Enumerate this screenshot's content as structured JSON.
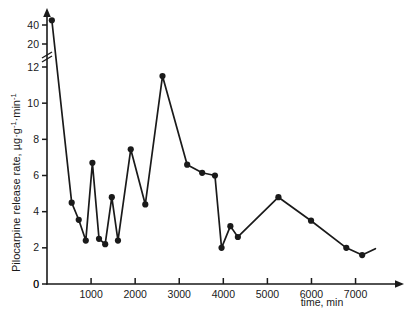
{
  "chart_data": {
    "type": "line",
    "title": "",
    "subtitle": "",
    "xlabel": "time, min",
    "ylabel": "Pilocarpine  release rate, µg·g⁻¹·min⁻¹",
    "ylabel_parts": {
      "main": "Pilocarpine  release rate, µg·g",
      "sup1": "-1",
      "mid": "·min",
      "sup2": "-1"
    },
    "xlim": [
      0,
      7600
    ],
    "ylim": [
      0,
      48
    ],
    "xticks": [
      0,
      1000,
      2000,
      3000,
      4000,
      5000,
      6000,
      7000
    ],
    "xticklabels": [
      "0",
      "1000",
      "2000",
      "3000",
      "4000",
      "5000",
      "6000",
      "7000"
    ],
    "yticks": [
      0,
      2,
      4,
      6,
      8,
      10,
      12,
      20,
      40
    ],
    "yticklabels": [
      "0",
      "2",
      "4",
      "6",
      "8",
      "10",
      "12",
      "20",
      "40"
    ],
    "y_axis_break": {
      "present": true,
      "between": [
        12,
        20
      ],
      "note": "broken (compressed) axis above 12"
    },
    "grid": false,
    "legend": null,
    "axis_arrows": {
      "x": true,
      "y": true
    },
    "marker": "filled-circle",
    "series": [
      {
        "name": "Pilocarpine release rate",
        "points": [
          {
            "x": 110,
            "y": 45.0
          },
          {
            "x": 560,
            "y": 4.5
          },
          {
            "x": 720,
            "y": 3.55
          },
          {
            "x": 880,
            "y": 2.4
          },
          {
            "x": 1030,
            "y": 6.7
          },
          {
            "x": 1180,
            "y": 2.5
          },
          {
            "x": 1320,
            "y": 2.2
          },
          {
            "x": 1470,
            "y": 4.8
          },
          {
            "x": 1610,
            "y": 2.4
          },
          {
            "x": 1900,
            "y": 7.45
          },
          {
            "x": 2230,
            "y": 4.4
          },
          {
            "x": 2620,
            "y": 11.5
          },
          {
            "x": 3180,
            "y": 6.6
          },
          {
            "x": 3520,
            "y": 6.15
          },
          {
            "x": 3810,
            "y": 6.0
          },
          {
            "x": 3960,
            "y": 2.0
          },
          {
            "x": 4160,
            "y": 3.2
          },
          {
            "x": 4330,
            "y": 2.6
          },
          {
            "x": 5250,
            "y": 4.8
          },
          {
            "x": 5990,
            "y": 3.5
          },
          {
            "x": 6790,
            "y": 2.0
          },
          {
            "x": 7150,
            "y": 1.6
          },
          {
            "x": 7450,
            "y": 1.95
          }
        ]
      }
    ],
    "colors": {
      "line": "#1a1a1a",
      "marker": "#1a1a1a",
      "axis": "#1a1a1a",
      "background": "#ffffff"
    }
  }
}
